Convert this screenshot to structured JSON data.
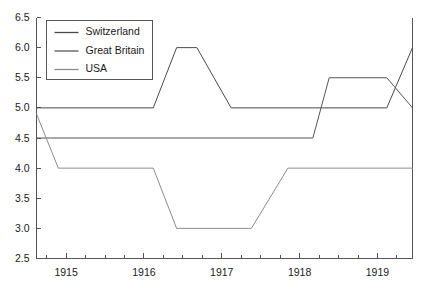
{
  "chart_data": {
    "type": "line",
    "title": "",
    "xlabel": "",
    "ylabel": "",
    "ylim": [
      2.5,
      6.5
    ],
    "xlim": [
      1914.62,
      1919.45
    ],
    "grid": false,
    "legend_position": "top-left",
    "ytick_labels": [
      "2.5",
      "3.0",
      "3.5",
      "4.0",
      "4.5",
      "5.0",
      "5.5",
      "6.0",
      "6.5"
    ],
    "ytick_values": [
      2.5,
      3.0,
      3.5,
      4.0,
      4.5,
      5.0,
      5.5,
      6.0,
      6.5
    ],
    "xtick_labels": [
      "1915",
      "1916",
      "1917",
      "1918",
      "1919"
    ],
    "xtick_values": [
      1915,
      1916,
      1917,
      1918,
      1919
    ],
    "minor_ticks_per_year": 4,
    "series": [
      {
        "name": "Switzerland",
        "color": "#4a4a4a",
        "x": [
          1914.62,
          1916.12,
          1916.42,
          1916.68,
          1917.12,
          1919.12,
          1919.45
        ],
        "values": [
          5.0,
          5.0,
          6.0,
          6.0,
          5.0,
          5.0,
          6.0
        ]
      },
      {
        "name": "Great Britain",
        "color": "#555555",
        "x": [
          1914.62,
          1918.17,
          1918.38,
          1919.12,
          1919.45
        ],
        "values": [
          4.5,
          4.5,
          5.5,
          5.5,
          5.0
        ]
      },
      {
        "name": "USA",
        "color": "#8c8c8c",
        "x": [
          1914.62,
          1914.9,
          1916.12,
          1916.42,
          1917.38,
          1917.85,
          1919.45
        ],
        "values": [
          4.9,
          4.0,
          4.0,
          3.0,
          3.0,
          4.0,
          4.0
        ]
      }
    ]
  },
  "legend": {
    "items": [
      {
        "label": "Switzerland"
      },
      {
        "label": "Great Britain"
      },
      {
        "label": "USA"
      }
    ]
  }
}
